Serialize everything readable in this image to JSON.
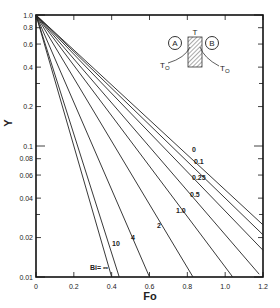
{
  "chart_data": {
    "type": "line",
    "title": "",
    "xlabel": "Fo",
    "ylabel": "Y",
    "xlim": [
      0,
      1.2
    ],
    "ylim": [
      0.01,
      1.0
    ],
    "yscale": "log",
    "grid": false,
    "x_ticks": [
      "0",
      "0.2",
      "0.4",
      "0.6",
      "0.8",
      "1.0",
      "1.2"
    ],
    "y_ticks": [
      "1.0",
      "0.8",
      "0.6",
      "0.4",
      "0.2",
      "0.1",
      "0.08",
      "0.06",
      "0.04",
      "0.02",
      "0.01"
    ],
    "parameter": "Bi",
    "series": [
      {
        "name": "Bi=∞",
        "label": "Bi= ∞",
        "points": [
          [
            0,
            1.0
          ],
          [
            0.4,
            0.01
          ]
        ]
      },
      {
        "name": "10",
        "label": "10",
        "points": [
          [
            0,
            1.0
          ],
          [
            0.44,
            0.01
          ]
        ]
      },
      {
        "name": "4",
        "label": "4",
        "points": [
          [
            0,
            1.0
          ],
          [
            0.6,
            0.01
          ]
        ]
      },
      {
        "name": "2",
        "label": "2",
        "points": [
          [
            0,
            1.0
          ],
          [
            0.83,
            0.01
          ]
        ]
      },
      {
        "name": "1.0",
        "label": "1.0",
        "points": [
          [
            0,
            1.0
          ],
          [
            1.04,
            0.01
          ]
        ]
      },
      {
        "name": "0.5",
        "label": "0.5",
        "points": [
          [
            0,
            1.0
          ],
          [
            1.18,
            0.0105
          ]
        ]
      },
      {
        "name": "0.25",
        "label": "0.25",
        "points": [
          [
            0,
            1.0
          ],
          [
            1.2,
            0.016
          ]
        ]
      },
      {
        "name": "0.1",
        "label": "0.1",
        "points": [
          [
            0,
            1.0
          ],
          [
            1.2,
            0.021
          ]
        ]
      },
      {
        "name": "0",
        "label": "0",
        "points": [
          [
            0,
            1.0
          ],
          [
            1.2,
            0.025
          ]
        ]
      }
    ],
    "inset_diagram": {
      "labels": [
        "A",
        "B",
        "T",
        "To",
        "To"
      ],
      "description": "Slab with hatched wall between fluids A and B; surface temperature T, ambient To on both sides"
    }
  }
}
